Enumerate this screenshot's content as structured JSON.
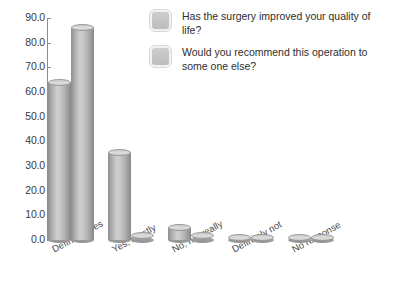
{
  "chart_data": {
    "type": "bar",
    "title": "",
    "xlabel": "",
    "ylabel": "",
    "ylim": [
      0,
      90
    ],
    "ytick_step": 10,
    "grid": false,
    "legend_position": "top-right",
    "categories": [
      "Definitely yes",
      "Yes, mostly",
      "No, not really",
      "Definitely not",
      "No response"
    ],
    "ytick_labels": [
      "0.0",
      "10.0",
      "20.0",
      "30.0",
      "40.0",
      "50.0",
      "60.0",
      "70.0",
      "80.0",
      "90.0"
    ],
    "series": [
      {
        "name": "Has the surgery improved your quality of life?",
        "color": "#b8b8b8",
        "values": [
          64.0,
          35.5,
          5.0,
          1.0,
          1.0
        ]
      },
      {
        "name": "Would you recommend this operation to some one else?",
        "color": "#b8b8b8",
        "values": [
          86.0,
          2.0,
          2.0,
          1.0,
          1.0
        ]
      }
    ]
  },
  "legend": {
    "items": [
      {
        "label": "Has the surgery improved your quality of life?"
      },
      {
        "label": "Would you recommend this operation to some one else?"
      }
    ]
  },
  "axis": {
    "y_ticks": [
      "90.0",
      "80.0",
      "70.0",
      "60.0",
      "50.0",
      "40.0",
      "30.0",
      "20.0",
      "10.0",
      "0.0"
    ]
  }
}
